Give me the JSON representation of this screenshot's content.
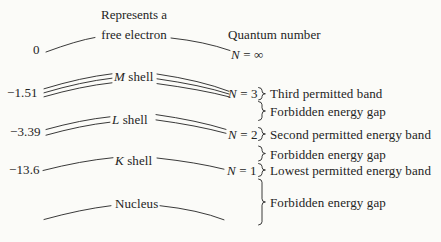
{
  "colors": {
    "background": "#fbfbf8",
    "ink": "#242424"
  },
  "header": {
    "free_electron_caption_line1": "Represents a",
    "free_electron_caption_line2": "free electron",
    "quantum_number_heading": "Quantum number"
  },
  "free_level": {
    "energy": "0",
    "n_letter": "N",
    "n_rest": "= ∞"
  },
  "shells": [
    {
      "energy": "−1.51",
      "letter": "M",
      "word": "shell",
      "n_letter": "N",
      "n_rest": "= 3",
      "band_label": "Third permitted band",
      "arc_count": 3
    },
    {
      "energy": "−3.39",
      "letter": "L",
      "word": "shell",
      "n_letter": "N",
      "n_rest": "= 2",
      "band_label": "Second permitted energy band",
      "arc_count": 2
    },
    {
      "energy": "−13.6",
      "letter": "K",
      "word": "shell",
      "n_letter": "N",
      "n_rest": "= 1",
      "band_label": "Lowest permitted energy band",
      "arc_count": 1
    }
  ],
  "gaps": [
    {
      "label": "Forbidden energy gap"
    },
    {
      "label": "Forbidden energy gap"
    },
    {
      "label": "Forbidden energy gap"
    }
  ],
  "nucleus": {
    "label": "Nucleus"
  }
}
